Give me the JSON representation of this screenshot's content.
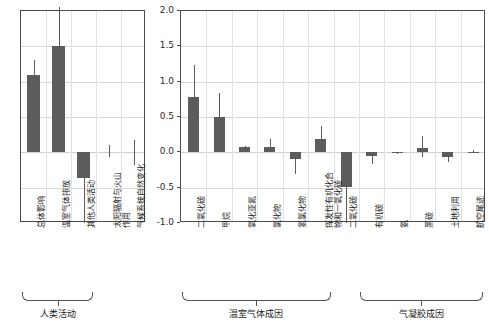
{
  "chart_data": {
    "type": "bar",
    "title": "",
    "xlabel": "",
    "ylabel": "",
    "ylim": [
      -1.0,
      2.0
    ],
    "ytick_labels": [
      "2.0",
      "1.5",
      "1.0",
      "0.5",
      "0.0",
      "-0.5",
      "-1.0"
    ],
    "ytick_values": [
      2.0,
      1.5,
      1.0,
      0.5,
      0.0,
      -0.5,
      -1.0
    ],
    "grid": true,
    "legend": "none",
    "bar_color": "#5c5c5c",
    "error_color": "#5a5a5a",
    "panels": [
      {
        "name": "left-panel",
        "categories": [
          "总体影响",
          "温室气体排放",
          "其他人类活动",
          "太阳辐射与火山作用",
          "气候系统自然变化"
        ],
        "values": [
          1.1,
          1.5,
          -0.37,
          0.0,
          0.0
        ],
        "err_low": [
          0.8,
          1.0,
          -1.0,
          -0.07,
          -0.18
        ],
        "err_high": [
          1.3,
          2.05,
          -0.37,
          0.1,
          0.18
        ],
        "groups": [
          {
            "label": "人类活动",
            "start": 0,
            "end": 2
          }
        ]
      },
      {
        "name": "right-panel",
        "categories": [
          "二氧化碳",
          "甲烷",
          "氧化亚氮",
          "氯化物",
          "氢氯化物",
          "挥发性有机化合物和一氧化碳",
          "二氧化碳",
          "有机碳",
          "氨",
          "黑碳",
          "土地利用",
          "航空尾迹"
        ],
        "values": [
          0.78,
          0.5,
          0.07,
          0.07,
          -0.1,
          0.19,
          -0.49,
          -0.05,
          -0.01,
          0.06,
          -0.06,
          0.01
        ],
        "err_low": [
          0.51,
          0.28,
          0.01,
          0.0,
          -0.31,
          0.03,
          -1.0,
          -0.16,
          -0.03,
          -0.07,
          -0.13,
          0.0
        ],
        "err_high": [
          1.23,
          0.84,
          0.09,
          0.19,
          -0.02,
          0.37,
          -0.12,
          -0.01,
          -0.01,
          0.23,
          -0.02,
          0.03
        ],
        "groups": [
          {
            "label": "温室气体成因",
            "start": 0,
            "end": 5
          },
          {
            "label": "气凝胶成因",
            "start": 7,
            "end": 11
          }
        ]
      }
    ]
  }
}
